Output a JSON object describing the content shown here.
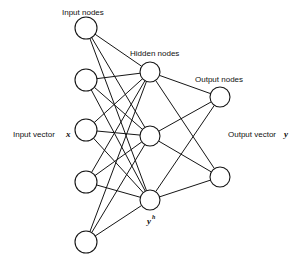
{
  "diagram": {
    "type": "feedforward-neural-network",
    "labels": {
      "input_nodes": "Input nodes",
      "hidden_nodes": "Hidden nodes",
      "output_nodes": "Output nodes",
      "input_vector": "Input vector",
      "input_vector_symbol": "x",
      "output_vector": "Output vector",
      "output_vector_symbol": "y",
      "hidden_symbol": "y",
      "hidden_symbol_superscript": "h"
    },
    "layers": {
      "input": {
        "count": 5,
        "x": 86,
        "radius": 11,
        "ys": [
          28,
          80,
          130,
          182,
          242
        ]
      },
      "hidden": {
        "count": 3,
        "x": 150,
        "radius": 10,
        "ys": [
          72,
          136,
          200
        ]
      },
      "output": {
        "count": 2,
        "x": 220,
        "radius": 10,
        "ys": [
          97,
          177
        ]
      }
    },
    "connectivity": "fully-connected between adjacent layers",
    "colors": {
      "stroke": "#151515",
      "background": "#ffffff",
      "text": "#111111"
    }
  }
}
